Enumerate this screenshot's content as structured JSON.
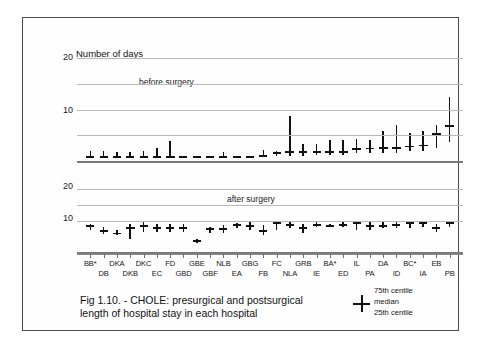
{
  "figure": {
    "caption": "Fig 1.10. - CHOLE: presurgical and postsurgical length of hospital stay  in each hospital",
    "legend": {
      "upper_label": "75th centile",
      "middle_label": "median",
      "lower_label": "25th centile",
      "glyph": "cross-whisker-icon"
    }
  },
  "chart_data": {
    "type": "box",
    "title": "Fig 1.10. - CHOLE: presurgical and postsurgical length of hospital stay  in each hospital",
    "ylabel": "Number of days",
    "xlabel": "",
    "grid": true,
    "legend_position": "bottom-right",
    "panels": [
      {
        "name": "before surgery",
        "annotation": "before surgery",
        "ylim": [
          0,
          21
        ],
        "yticks": [
          20,
          10
        ],
        "gridlines": [
          20,
          15,
          10,
          5
        ],
        "series": [
          {
            "name": "25th centile",
            "values": [
              1.0,
              1.0,
              1.0,
              1.0,
              1.0,
              1.0,
              1.0,
              1.0,
              1.0,
              1.0,
              1.0,
              1.0,
              1.0,
              1.0,
              1.0,
              1.0,
              1.0,
              1.2,
              1.2,
              1.2,
              1.5,
              1.5,
              1.5,
              1.5,
              2.0,
              2.0,
              2.5,
              3.6
            ]
          },
          {
            "name": "median",
            "values": [
              1.0,
              1.0,
              1.0,
              1.0,
              1.0,
              1.0,
              1.0,
              1.0,
              1.0,
              1.0,
              1.0,
              1.0,
              1.0,
              1.2,
              1.8,
              2.0,
              2.0,
              2.0,
              2.0,
              2.0,
              2.5,
              2.6,
              2.7,
              2.7,
              3.0,
              3.2,
              5.5,
              7.0
            ]
          },
          {
            "name": "75th centile",
            "values": [
              1.9,
              1.9,
              1.8,
              1.8,
              2.0,
              2.6,
              3.8,
              1.0,
              1.0,
              1.0,
              1.8,
              1.0,
              1.0,
              2.1,
              2.0,
              8.7,
              3.4,
              3.3,
              4.1,
              4.1,
              4.3,
              4.0,
              5.9,
              7.0,
              5.4,
              5.9,
              7.0,
              12.5,
              20.0
            ]
          }
        ]
      },
      {
        "name": "after surgery",
        "annotation": "after surgery",
        "ylim": [
          0,
          21
        ],
        "yticks": [
          20,
          10
        ],
        "gridlines": [
          20,
          15,
          10
        ],
        "series": [
          {
            "name": "25th centile",
            "values": [
              7.0,
              5.8,
              5.5,
              4.0,
              6.5,
              6.5,
              6.5,
              6.5,
              3.0,
              6.0,
              6.0,
              7.5,
              7.0,
              5.5,
              7.0,
              7.5,
              6.0,
              7.8,
              8.0,
              8.0,
              7.0,
              7.0,
              7.5,
              7.5,
              7.5,
              8.0,
              6.5,
              8.0
            ]
          },
          {
            "name": "median",
            "values": [
              8.5,
              7.0,
              6.2,
              8.0,
              8.5,
              8.0,
              8.0,
              7.8,
              3.8,
              7.5,
              7.5,
              9.0,
              8.5,
              7.0,
              9.5,
              9.0,
              8.0,
              9.0,
              8.5,
              9.0,
              9.5,
              8.5,
              8.5,
              9.0,
              9.5,
              9.5,
              8.0,
              9.5
            ]
          },
          {
            "name": "75th centile",
            "values": [
              9.0,
              7.8,
              7.0,
              9.0,
              9.5,
              9.0,
              9.0,
              9.0,
              4.0,
              8.0,
              8.5,
              9.2,
              9.5,
              8.5,
              10.0,
              9.5,
              9.0,
              9.5,
              9.0,
              9.5,
              10.0,
              9.5,
              9.5,
              10.0,
              10.0,
              10.0,
              9.0,
              10.0
            ]
          }
        ]
      }
    ],
    "categories": [
      "BB*",
      "DB",
      "DKA",
      "DKB",
      "DKC",
      "EC",
      "FD",
      "GBD",
      "GBE",
      "GBF",
      "NLB",
      "EA",
      "GBG",
      "FB",
      "FC",
      "NLA",
      "GRB",
      "IE",
      "BA*",
      "ED",
      "IL",
      "PA",
      "DA",
      "ID",
      "BC*",
      "IA",
      "EB",
      "PB"
    ],
    "tick_labels_row_a": [
      "BB*",
      "DKA",
      "DKC",
      "FD",
      "GBE",
      "NLB",
      "GBG",
      "FC",
      "GRB",
      "BA*",
      "IL",
      "DA",
      "BC*",
      "EB"
    ],
    "tick_labels_row_b": [
      "DB",
      "DKB",
      "EC",
      "GBD",
      "GBF",
      "EA",
      "FB",
      "NLA",
      "IE",
      "ED",
      "PA",
      "ID",
      "IA",
      "PB"
    ]
  }
}
